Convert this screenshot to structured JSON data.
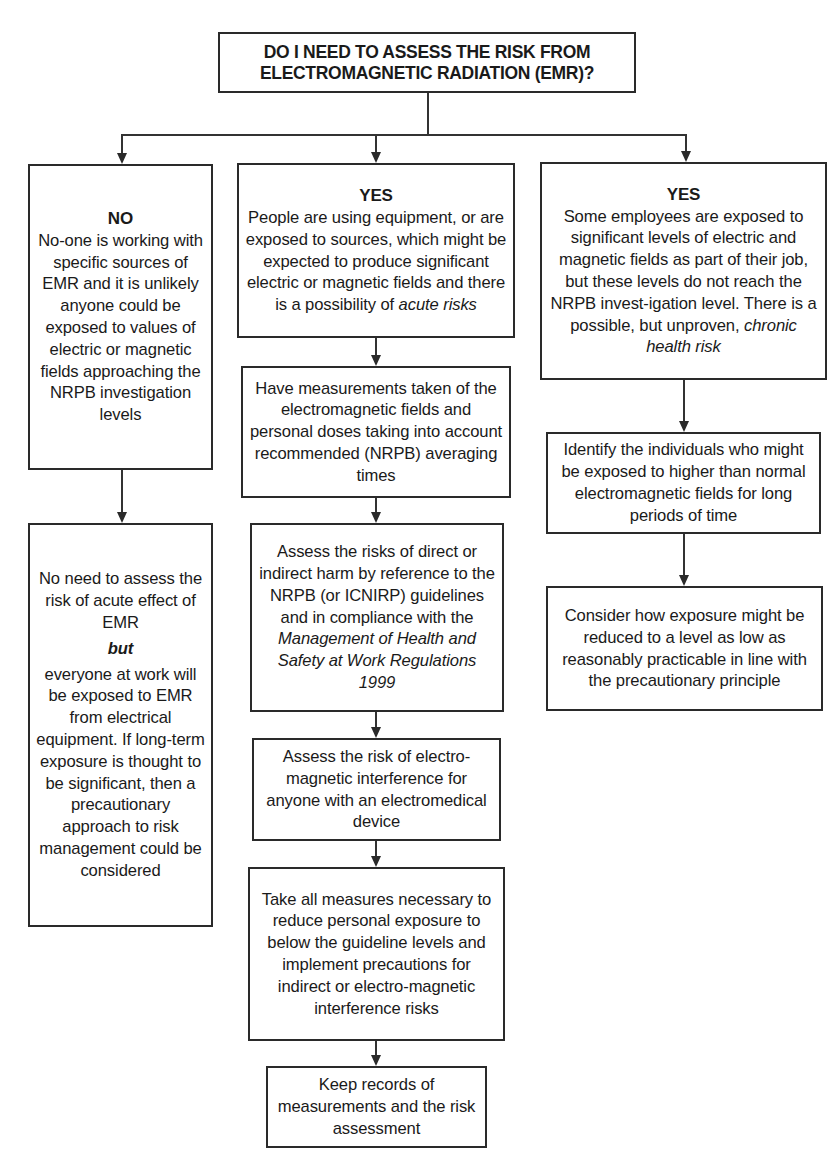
{
  "diagram": {
    "top_question": {
      "line1": "DO I NEED TO ASSESS THE RISK FROM",
      "line2": "ELECTROMAGNETIC RADIATION (EMR)?"
    },
    "branches": {
      "left": {
        "heading": "NO",
        "box1": {
          "text": "No-one is working with specific sources of EMR and it is unlikely anyone could be exposed to values of electric or magnetic fields approaching the NRPB investigation levels"
        },
        "box2": {
          "text_before": "No need to assess the risk of acute effect of EMR",
          "emphasis": "but",
          "text_after": "everyone at work will be exposed to EMR from electrical equipment. If long-term exposure is thought to be significant, then a precautionary approach to risk management could be considered"
        }
      },
      "middle": {
        "heading": "YES",
        "box1": {
          "text": "People are using equipment, or are exposed to sources, which might be expected to produce significant electric or magnetic fields and there is a possibility of",
          "italic": "acute risks"
        },
        "box2": {
          "text": "Have measurements taken of the electromagnetic fields and personal doses taking into account recommended (NRPB) averaging times"
        },
        "box3": {
          "text": "Assess the risks of direct or indirect harm by reference to the NRPB (or ICNIRP) guidelines and in compliance with the",
          "italic": "Management of Health and Safety at Work Regulations 1999"
        },
        "box4": {
          "text": "Assess the risk of electro-magnetic interference for anyone with an electromedical device"
        },
        "box5": {
          "text": "Take all measures necessary to reduce personal exposure to below the guideline levels and implement precautions for indirect or electro-magnetic interference risks"
        },
        "box6": {
          "text": "Keep records of measurements and the risk assessment"
        }
      },
      "right": {
        "heading": "YES",
        "box1": {
          "text": "Some employees are exposed to significant levels of electric and magnetic fields as part of their job, but these levels do not reach the NRPB invest-igation level. There is a possible, but unproven,",
          "italic": "chronic health risk"
        },
        "box2": {
          "text": "Identify the individuals who might be exposed to higher than normal electromagnetic fields for long periods of time"
        },
        "box3": {
          "text": "Consider how exposure might be reduced to a level as low as reasonably practicable in line with the precautionary principle"
        }
      }
    }
  }
}
